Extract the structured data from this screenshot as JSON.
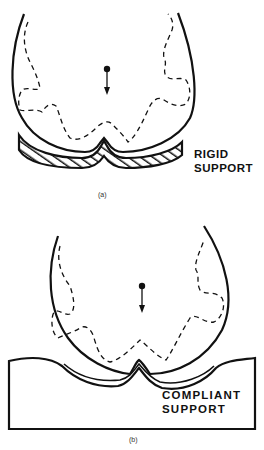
{
  "figure_a": {
    "label_line1": "RIGID",
    "label_line2": "SUPPORT",
    "caption": "(a)"
  },
  "figure_b": {
    "label_line1": "COMPLIANT",
    "label_line2": "SUPPORT",
    "caption": "(b)"
  },
  "colors": {
    "stroke": "#111111",
    "background": "#ffffff"
  }
}
